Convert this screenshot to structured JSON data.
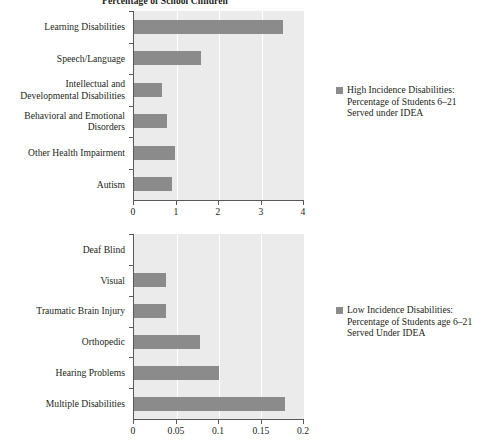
{
  "chart_data": [
    {
      "id": "high-incidence",
      "type": "bar",
      "orientation": "horizontal",
      "title": "Percentage of School Children",
      "xlabel": "",
      "ylabel": "",
      "xlim": [
        0,
        4
      ],
      "xticks": [
        "0",
        "1",
        "2",
        "3",
        "4"
      ],
      "xtick_values": [
        0,
        1,
        2,
        3,
        4
      ],
      "grid": true,
      "grid_color": "#ffffff",
      "plot_background": "#ebebeb",
      "bar_color": "#8b8b8b",
      "legend_position": "right",
      "categories": [
        "Learning Disabilities",
        "Speech/Language",
        "Intellectual and\nDevelopmental Disabilities",
        "Behavioral and Emotional\nDisorders",
        "Other Health Impairment",
        "Autism"
      ],
      "values": [
        3.5,
        1.57,
        0.67,
        0.77,
        0.97,
        0.9
      ],
      "legend": [
        "High Incidence Disabilities:\nPercentage of Students 6–21\nServed under IDEA"
      ]
    },
    {
      "id": "low-incidence",
      "type": "bar",
      "orientation": "horizontal",
      "title": "",
      "xlabel": "",
      "ylabel": "",
      "xlim": [
        0,
        0.2
      ],
      "xticks": [
        "0",
        "0.05",
        "0.1",
        "0.15",
        "0.2"
      ],
      "xtick_values": [
        0,
        0.05,
        0.1,
        0.15,
        0.2
      ],
      "grid": true,
      "grid_color": "#ffffff",
      "plot_background": "#ebebeb",
      "bar_color": "#8b8b8b",
      "legend_position": "right",
      "categories": [
        "Deaf Blind",
        "Visual",
        "Traumatic Brain Injury",
        "Orthopedic",
        "Hearing Problems",
        "Multiple Disabilities"
      ],
      "values": [
        0.0,
        0.038,
        0.038,
        0.078,
        0.1,
        0.178
      ],
      "legend": [
        "Low Incidence Disabilities:\nPercentage of Students age 6–21\nServed Under IDEA"
      ]
    }
  ],
  "top": {
    "title": "Percentage of School Children",
    "categories": [
      "Learning Disabilities",
      "Speech/Language",
      "Intellectual and\nDevelopmental Disabilities",
      "Behavioral and Emotional\nDisorders",
      "Other Health Impairment",
      "Autism"
    ],
    "xticks": [
      "0",
      "1",
      "2",
      "3",
      "4"
    ],
    "legend_label": "High Incidence Disabilities:\nPercentage of Students 6–21\nServed under IDEA"
  },
  "bottom": {
    "title": "",
    "categories": [
      "Deaf Blind",
      "Visual",
      "Traumatic Brain Injury",
      "Orthopedic",
      "Hearing Problems",
      "Multiple Disabilities"
    ],
    "xticks": [
      "0",
      "0.05",
      "0.1",
      "0.15",
      "0.2"
    ],
    "legend_label": "Low Incidence Disabilities:\nPercentage of Students age 6–21\nServed Under IDEA"
  }
}
